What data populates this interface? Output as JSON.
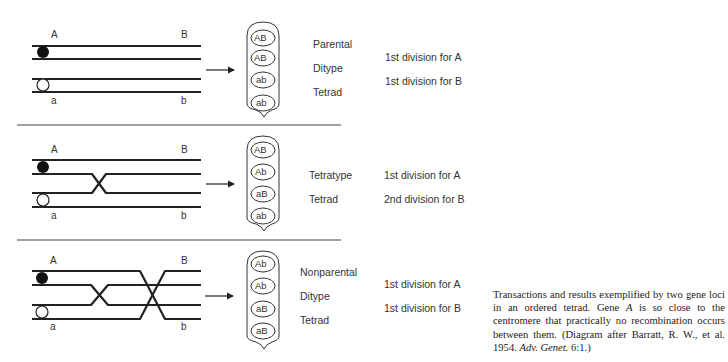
{
  "panels": [
    {
      "id": "parental-ditype",
      "labels": {
        "A": "A",
        "B": "B",
        "a": "a",
        "b": "b"
      },
      "ascus_spores": [
        "AB",
        "AB",
        "ab",
        "ab"
      ],
      "type_lines": [
        "Parental",
        "Ditype",
        "Tetrad"
      ],
      "division_lines": [
        "1st division for A",
        "1st division for B"
      ]
    },
    {
      "id": "tetratype",
      "labels": {
        "A": "A",
        "B": "B",
        "a": "a",
        "b": "b"
      },
      "ascus_spores": [
        "AB",
        "Ab",
        "aB",
        "ab"
      ],
      "type_lines": [
        "Tetratype",
        "Tetrad"
      ],
      "division_lines": [
        "1st division for A",
        "2nd division for B"
      ]
    },
    {
      "id": "nonparental-ditype",
      "labels": {
        "A": "A",
        "B": "B",
        "a": "a",
        "b": "b"
      },
      "ascus_spores": [
        "Ab",
        "Ab",
        "aB",
        "aB"
      ],
      "type_lines": [
        "Nonparental",
        "Ditype",
        "Tetrad"
      ],
      "division_lines": [
        "1st division for A",
        "1st division for B"
      ]
    }
  ],
  "caption": {
    "part1": "Transactions and results exemplified by two gene loci in an ordered tetrad. Gene ",
    "gene": "A",
    "part2": " is so close to the centromere that practically no recombination occurs between them. (Diagram after Barratt, R. W., et al. 1954. ",
    "journal": "Adv. Genet.",
    "part3": " 6:1.)"
  },
  "colors": {
    "line": "#222222",
    "text": "#333333"
  }
}
